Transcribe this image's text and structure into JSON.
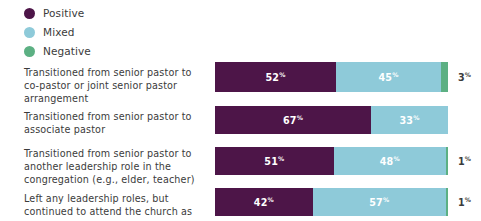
{
  "legend": {
    "items": [
      {
        "label": "Positive",
        "color": "#4d1548",
        "icon": "circle-swatch-icon"
      },
      {
        "label": "Mixed",
        "color": "#8ecad9",
        "icon": "circle-swatch-icon"
      },
      {
        "label": "Negative",
        "color": "#5cb083",
        "icon": "circle-swatch-icon"
      }
    ]
  },
  "chart_data": {
    "type": "bar",
    "title": "",
    "subtitle": "",
    "xlabel": "",
    "ylabel": "",
    "orientation": "horizontal",
    "stacked": true,
    "normalized_percent": true,
    "xlim": [
      0,
      100
    ],
    "grid": false,
    "legend_position": "top-left",
    "categories": [
      "Transitioned from senior pastor to co-pastor or joint senior pastor arrangement",
      "Transitioned from senior pastor to associate pastor",
      "Transitioned from senior pastor to another leadership role in the congregation (e.g., elder, teacher)",
      "Left any leadership roles, but continued to attend the church as"
    ],
    "series": [
      {
        "name": "Positive",
        "color": "#4d1548",
        "values": [
          52,
          67,
          51,
          42
        ]
      },
      {
        "name": "Mixed",
        "color": "#8ecad9",
        "values": [
          45,
          33,
          48,
          57
        ]
      },
      {
        "name": "Negative",
        "color": "#5cb083",
        "values": [
          3,
          0,
          1,
          1
        ]
      }
    ],
    "percent_symbol": "%",
    "rows": [
      {
        "label": "Transitioned from senior pastor to co-pastor or joint senior pastor arrangement",
        "height_px": 30,
        "top_px": 0,
        "label_top_px": 4,
        "segments": [
          {
            "name": "Positive",
            "value": 52,
            "label": "52",
            "color": "#4d1548",
            "label_inside": true
          },
          {
            "name": "Mixed",
            "value": 45,
            "label": "45",
            "color": "#8ecad9",
            "label_inside": true
          },
          {
            "name": "Negative",
            "value": 3,
            "label": "3",
            "color": "#5cb083",
            "label_inside": false
          }
        ]
      },
      {
        "label": "Transitioned from senior pastor to associate pastor",
        "height_px": 28,
        "top_px": 44,
        "label_top_px": 4,
        "segments": [
          {
            "name": "Positive",
            "value": 67,
            "label": "67",
            "color": "#4d1548",
            "label_inside": true
          },
          {
            "name": "Mixed",
            "value": 33,
            "label": "33",
            "color": "#8ecad9",
            "label_inside": true
          }
        ]
      },
      {
        "label": "Transitioned from senior pastor to another leadership role in the congregation (e.g., elder, teacher)",
        "height_px": 28,
        "top_px": 85,
        "label_top_px": 0,
        "segments": [
          {
            "name": "Positive",
            "value": 51,
            "label": "51",
            "color": "#4d1548",
            "label_inside": true
          },
          {
            "name": "Mixed",
            "value": 48,
            "label": "48",
            "color": "#8ecad9",
            "label_inside": true
          },
          {
            "name": "Negative",
            "value": 1,
            "label": "1",
            "color": "#5cb083",
            "label_inside": false
          }
        ]
      },
      {
        "label": "Left any leadership roles, but continued to attend the church as",
        "height_px": 28,
        "top_px": 126,
        "label_top_px": 4,
        "segments": [
          {
            "name": "Positive",
            "value": 42,
            "label": "42",
            "color": "#4d1548",
            "label_inside": true
          },
          {
            "name": "Mixed",
            "value": 57,
            "label": "57",
            "color": "#8ecad9",
            "label_inside": true
          },
          {
            "name": "Negative",
            "value": 1,
            "label": "1",
            "color": "#5cb083",
            "label_inside": false
          }
        ]
      }
    ]
  }
}
